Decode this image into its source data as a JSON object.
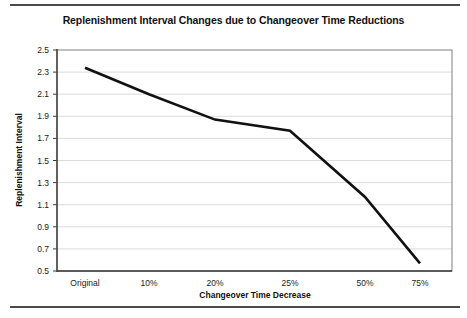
{
  "figure": {
    "title": "Replenishment Interval Changes due to Changeover Time Reductions",
    "rule_color": "#4a4a4a"
  },
  "chart_data": {
    "type": "line",
    "title": "Replenishment Interval Changes due to Changeover Time Reductions",
    "xlabel": "Changeover Time Decrease",
    "ylabel": "Replenishment Interval",
    "categories": [
      "Original",
      "10%",
      "20%",
      "25%",
      "50%",
      "75%"
    ],
    "values": [
      2.34,
      2.1,
      1.87,
      1.77,
      1.17,
      0.57
    ],
    "series": [
      {
        "name": "Replenishment Interval",
        "values": [
          2.34,
          2.1,
          1.87,
          1.77,
          1.17,
          0.57
        ],
        "color": "#111111"
      }
    ],
    "yticks": [
      0.5,
      0.7,
      0.9,
      1.1,
      1.3,
      1.5,
      1.7,
      1.9,
      2.1,
      2.3,
      2.5
    ],
    "ytick_labels": [
      "0.5",
      "0.7",
      "0.9",
      "1.1",
      "1.3",
      "1.5",
      "1.7",
      "1.9",
      "2.1",
      "2.3",
      "2.5"
    ],
    "ylim": [
      0.5,
      2.5
    ],
    "grid": "horizontal",
    "legend": "none",
    "line_color": "#111111",
    "gridline_color": "#d2d2d2",
    "frame_color": "#8a8a8a"
  }
}
